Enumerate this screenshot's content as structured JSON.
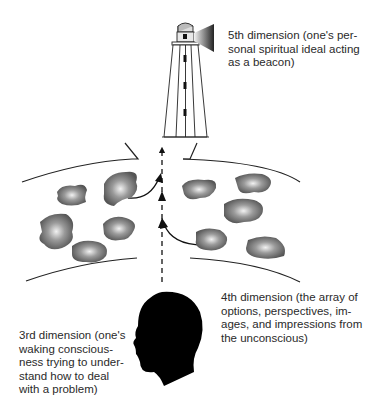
{
  "labels": {
    "fifth": "5th dimension (one's per-\nsonal spiritual ideal acting\nas a beacon)",
    "fourth": "4th dimension (the array of\noptions, perspectives, im-\nages, and impressions from\nthe unconscious)",
    "third": "3rd dimension (one's\nwaking conscious-\nness trying to under-\nstand how to deal\nwith a problem)"
  },
  "elements": {
    "lighthouse": "lighthouse-beacon",
    "head": "head-silhouette",
    "blobs_left": 5,
    "blobs_right": 5
  }
}
